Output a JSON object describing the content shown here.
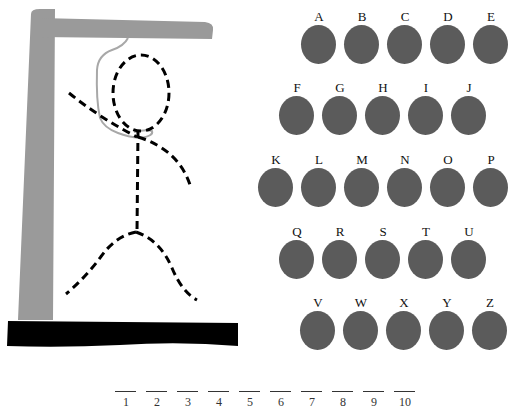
{
  "game": {
    "type": "hangman",
    "colors": {
      "gallows_post": "#9a9a9a",
      "gallows_base": "#000000",
      "rope": "#a8a8a8",
      "figure": "#000000",
      "letter_button": "#5b5b5b",
      "letter_text": "#111111"
    },
    "letter_rows": [
      {
        "top": 10,
        "left": 301,
        "letters": [
          "A",
          "B",
          "C",
          "D",
          "E"
        ]
      },
      {
        "top": 81,
        "left": 279,
        "letters": [
          "F",
          "G",
          "H",
          "I",
          "J"
        ]
      },
      {
        "top": 153,
        "left": 258,
        "letters": [
          "K",
          "L",
          "M",
          "N",
          "O",
          "P"
        ]
      },
      {
        "top": 225,
        "left": 279,
        "letters": [
          "Q",
          "R",
          "S",
          "T",
          "U"
        ]
      },
      {
        "top": 296,
        "left": 300,
        "letters": [
          "V",
          "W",
          "X",
          "Y",
          "Z"
        ]
      }
    ],
    "blanks": [
      "1",
      "2",
      "3",
      "4",
      "5",
      "6",
      "7",
      "8",
      "9",
      "10"
    ]
  }
}
